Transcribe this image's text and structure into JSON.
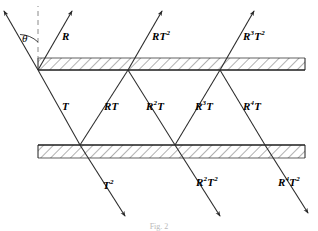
{
  "figure": {
    "caption": "Fig. 2",
    "angle_label": "θ",
    "background_color": "#ffffff",
    "line_color": "#2b2b2b",
    "hatch_color": "#4a4a4a"
  },
  "surfaces": [
    {
      "name": "top-surface",
      "y": 70,
      "x_start": 38,
      "x_end": 305,
      "hatch_side": "above"
    },
    {
      "name": "bottom-surface",
      "y": 145,
      "x_start": 38,
      "x_end": 305,
      "hatch_side": "below"
    }
  ],
  "geometry": {
    "top_hits": [
      38,
      128,
      220
    ],
    "bottom_hits": [
      80,
      175,
      265
    ],
    "normal_x": 38,
    "normal_top_y": 8,
    "incident_start_x": 3,
    "incident_start_y": 10
  },
  "rays": {
    "incident": {
      "name": "incident-ray",
      "label": ""
    },
    "reflected_top": [
      {
        "label_base": "R",
        "label_sup": "",
        "label_x": 62,
        "label_y": 31
      },
      {
        "label_base": "RT",
        "label_sup": "2",
        "label_x": 152,
        "label_y": 31
      },
      {
        "label_base": "R",
        "label_sup": "3",
        "label_base2": "T",
        "label_sup2": "2",
        "label_x": 243,
        "label_y": 31
      }
    ],
    "internal": [
      {
        "label_base": "T",
        "label_sup": "",
        "label_x": 62,
        "label_y": 101
      },
      {
        "label_base": "RT",
        "label_sup": "",
        "label_x": 104,
        "label_y": 101
      },
      {
        "label_base": "R",
        "label_sup": "2",
        "label_base2": "T",
        "label_x": 146,
        "label_y": 101
      },
      {
        "label_base": "R",
        "label_sup": "3",
        "label_base2": "T",
        "label_x": 195,
        "label_y": 101
      },
      {
        "label_base": "R",
        "label_sup": "4",
        "label_base2": "T",
        "label_x": 243,
        "label_y": 101
      }
    ],
    "transmitted_bottom": [
      {
        "label_base": "T",
        "label_sup": "2",
        "label_x": 103,
        "label_y": 180
      },
      {
        "label_base": "R",
        "label_sup": "2",
        "label_base2": "T",
        "label_sup2": "2",
        "label_x": 196,
        "label_y": 177
      },
      {
        "label_base": "R",
        "label_sup": "4",
        "label_base2": "T",
        "label_sup2": "2",
        "label_x": 278,
        "label_y": 177
      }
    ]
  },
  "labels": {
    "R": "R",
    "T": "T",
    "RT": "RT",
    "two": "2",
    "three": "3",
    "four": "4"
  }
}
